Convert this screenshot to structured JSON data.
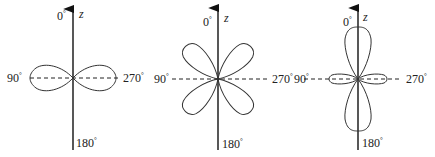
{
  "figure": {
    "type": "angular distribution polar plots",
    "panels": [
      {
        "id": "panel-1",
        "axis_label": "z",
        "angle_labels": {
          "top": "0",
          "left": "90",
          "right": "270",
          "bottom": "180"
        },
        "degree_mark": "°",
        "shape": "two horizontal lobes (dumbbell along 90°–270°)"
      },
      {
        "id": "panel-2",
        "axis_label": "z",
        "angle_labels": {
          "top": "0",
          "left": "90",
          "right": "270",
          "bottom": "180"
        },
        "degree_mark": "°",
        "shape": "four diagonal lobes (cloverleaf at 45° angles)"
      },
      {
        "id": "panel-3",
        "axis_label": "z",
        "angle_labels": {
          "top": "0",
          "left": "90",
          "right": "270",
          "bottom": "180"
        },
        "degree_mark": "°",
        "shape": "two large vertical lobes along z with small horizontal torus lobes"
      }
    ]
  }
}
